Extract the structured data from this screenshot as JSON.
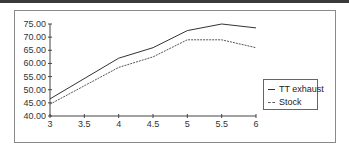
{
  "chart_data": {
    "type": "line",
    "title": "",
    "xlabel": "",
    "ylabel": "",
    "x": [
      3,
      4,
      4.5,
      5,
      5.5,
      6
    ],
    "x_ticks": [
      "3",
      "3.5",
      "4",
      "4.5",
      "5",
      "5.5",
      "6"
    ],
    "y_ticks": [
      "40.00",
      "45.00",
      "50.00",
      "55.00",
      "60.00",
      "65.00",
      "70.00",
      "75.00"
    ],
    "xlim": [
      3,
      6
    ],
    "ylim": [
      40,
      75
    ],
    "grid": false,
    "legend_position": "right",
    "series": [
      {
        "name": "TT exhaust",
        "style": "solid",
        "values": [
          46.5,
          62.0,
          66.0,
          72.5,
          75.0,
          73.5
        ]
      },
      {
        "name": "Stock",
        "style": "dashed",
        "values": [
          44.5,
          58.5,
          62.5,
          69.0,
          69.0,
          66.0
        ]
      }
    ]
  },
  "legend": {
    "items": [
      {
        "label": "TT exhaust"
      },
      {
        "label": "Stock"
      }
    ]
  }
}
